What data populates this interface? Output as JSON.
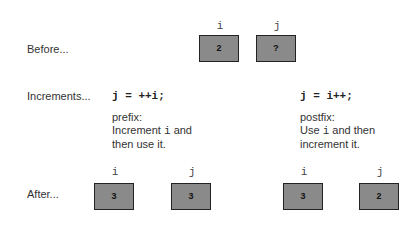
{
  "before": {
    "label": "Before...",
    "vars": [
      {
        "name": "i",
        "value": "2"
      },
      {
        "name": "j",
        "value": "?"
      }
    ]
  },
  "increments": {
    "label": "Increments...",
    "prefix": {
      "code": "j = ++i;",
      "title": "prefix:",
      "line1_pre": "Increment ",
      "line1_var": "i",
      "line1_post": " and",
      "line2": "then use it."
    },
    "postfix": {
      "code": "j = i++;",
      "title": "postfix:",
      "line1_pre": "Use ",
      "line1_var": "i",
      "line1_post": " and then",
      "line2": "increment it."
    }
  },
  "after": {
    "label": "After...",
    "prefix_vars": [
      {
        "name": "i",
        "value": "3"
      },
      {
        "name": "j",
        "value": "3"
      }
    ],
    "postfix_vars": [
      {
        "name": "i",
        "value": "3"
      },
      {
        "name": "j",
        "value": "2"
      }
    ]
  }
}
